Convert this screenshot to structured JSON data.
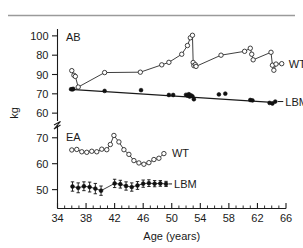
{
  "figure": {
    "top_rule": true,
    "axis_break": true
  },
  "chart_data": {
    "type": "line",
    "title": "",
    "xlabel": "Age (years)",
    "ylabel": "kg",
    "xlim": [
      34,
      66
    ],
    "xticks": [
      34,
      38,
      42,
      46,
      50,
      54,
      58,
      62,
      66
    ],
    "xtick_labels": [
      "34",
      "38",
      "42",
      "46",
      "50",
      "54",
      "58",
      "62",
      "66"
    ],
    "xminor_step": 1,
    "grid": false,
    "legend_position": "right-inline-endpoint-labels",
    "broken_axis": true,
    "panels": [
      {
        "id": "upper",
        "subject_label": "AB",
        "ylim": [
          58,
          102
        ],
        "yticks": [
          100,
          90,
          80,
          70,
          60
        ],
        "ytick_labels": [
          "100",
          "80",
          "90",
          "70",
          "60"
        ],
        "series": [
          {
            "name": "WT",
            "label": "WT",
            "marker": "open-circle",
            "connected": true,
            "points": [
              [
                36.0,
                82.0
              ],
              [
                36.3,
                79.6
              ],
              [
                36.5,
                79.0
              ],
              [
                36.9,
                73.5
              ],
              [
                40.6,
                81.0
              ],
              [
                45.6,
                81.2
              ],
              [
                48.6,
                85.0
              ],
              [
                49.6,
                86.3
              ],
              [
                51.4,
                90.5
              ],
              [
                52.2,
                95.0
              ],
              [
                52.6,
                99.0
              ],
              [
                52.9,
                100.3
              ],
              [
                53.0,
                86.2
              ],
              [
                53.1,
                84.6
              ],
              [
                53.3,
                85.1
              ],
              [
                53.4,
                84.2
              ],
              [
                56.9,
                90.0
              ],
              [
                60.2,
                92.0
              ],
              [
                61.0,
                93.6
              ],
              [
                61.2,
                90.5
              ],
              [
                61.4,
                87.6
              ],
              [
                63.9,
                91.5
              ],
              [
                64.1,
                84.8
              ],
              [
                64.3,
                82.2
              ],
              [
                64.6,
                85.4
              ],
              [
                65.4,
                85.6
              ]
            ]
          },
          {
            "name": "LBM",
            "label": "LBM",
            "marker": "filled-circle",
            "connected": false,
            "trend": [
              [
                35.8,
                72.3
              ],
              [
                64.6,
                65.4
              ]
            ],
            "points": [
              [
                35.9,
                72.4
              ],
              [
                36.1,
                72.3
              ],
              [
                36.2,
                72.6
              ],
              [
                40.6,
                71.5
              ],
              [
                45.7,
                71.9
              ],
              [
                49.6,
                69.4
              ],
              [
                50.2,
                69.4
              ],
              [
                52.0,
                69.5
              ],
              [
                52.2,
                69.1
              ],
              [
                52.4,
                69.8
              ],
              [
                52.5,
                68.6
              ],
              [
                52.7,
                69.2
              ],
              [
                52.9,
                68.7
              ],
              [
                53.1,
                67.2
              ],
              [
                56.6,
                69.7
              ],
              [
                57.5,
                70.1
              ],
              [
                61.0,
                66.8
              ],
              [
                61.3,
                66.6
              ],
              [
                63.7,
                65.3
              ],
              [
                64.1,
                65.0
              ],
              [
                64.5,
                66.0
              ]
            ]
          }
        ]
      },
      {
        "id": "lower",
        "subject_label": "EA",
        "ylim": [
          46,
          73
        ],
        "yticks": [
          70,
          60,
          50
        ],
        "ytick_labels": [
          "70",
          "60",
          "50"
        ],
        "series": [
          {
            "name": "WT",
            "label": "WT",
            "marker": "open-circle",
            "connected": true,
            "points": [
              [
                36.0,
                65.3
              ],
              [
                36.7,
                65.5
              ],
              [
                37.4,
                64.6
              ],
              [
                38.1,
                64.4
              ],
              [
                38.8,
                64.8
              ],
              [
                39.5,
                64.6
              ],
              [
                40.2,
                65.6
              ],
              [
                40.9,
                65.4
              ],
              [
                41.4,
                67.4
              ],
              [
                41.9,
                70.9
              ],
              [
                42.6,
                68.4
              ],
              [
                43.3,
                65.4
              ],
              [
                44.0,
                63.6
              ],
              [
                44.7,
                61.2
              ],
              [
                45.4,
                60.3
              ],
              [
                46.1,
                59.8
              ],
              [
                46.8,
                60.4
              ],
              [
                47.5,
                61.6
              ],
              [
                48.2,
                62.1
              ],
              [
                48.9,
                63.9
              ]
            ]
          },
          {
            "name": "LBM",
            "label": "LBM",
            "marker": "filled-circle",
            "connected": true,
            "error_bars": true,
            "points": [
              [
                36.1,
                51.2
              ],
              [
                36.9,
                50.7
              ],
              [
                37.7,
                51.3
              ],
              [
                38.5,
                51.0
              ],
              [
                39.3,
                50.4
              ],
              [
                40.1,
                49.6
              ],
              [
                42.0,
                52.4
              ],
              [
                42.8,
                52.1
              ],
              [
                43.6,
                51.4
              ],
              [
                44.4,
                51.0
              ],
              [
                45.2,
                51.6
              ],
              [
                46.0,
                52.3
              ],
              [
                46.8,
                52.5
              ],
              [
                47.6,
                52.3
              ],
              [
                48.4,
                52.4
              ],
              [
                49.2,
                52.2
              ]
            ],
            "errors": [
              1.8,
              1.9,
              1.7,
              1.9,
              2.0,
              1.8,
              1.6,
              1.5,
              1.6,
              1.6,
              1.5,
              1.4,
              1.3,
              1.2,
              1.1,
              1.0
            ]
          }
        ]
      }
    ]
  }
}
